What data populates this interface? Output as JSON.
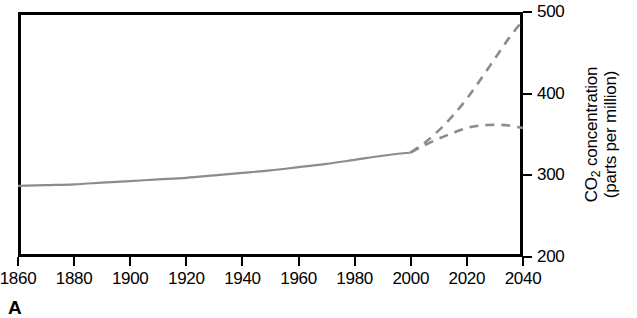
{
  "panel": {
    "letter": "A"
  },
  "chart_data": {
    "type": "line",
    "title": "",
    "xlabel": "",
    "ylabel": "CO2 concentration (parts per million)",
    "ylabel_line1": "CO",
    "ylabel_line1_sub": "2",
    "ylabel_line1_rest": " concentration",
    "ylabel_line2": "(parts per million)",
    "xlim": [
      1860,
      2040
    ],
    "ylim": [
      200,
      500
    ],
    "xticks": [
      1860,
      1880,
      1900,
      1920,
      1940,
      1960,
      1980,
      2000,
      2020,
      2040
    ],
    "xtick_labels": [
      "1860",
      "1880",
      "1900",
      "1920",
      "1940",
      "1960",
      "1980",
      "2000",
      "2020",
      "2040"
    ],
    "yticks": [
      200,
      300,
      400,
      500
    ],
    "ytick_labels": [
      "200",
      "300",
      "400",
      "500"
    ],
    "yaxis_position": "right",
    "grid": false,
    "legend": false,
    "line_color": "#8c8c8c",
    "frame_color": "#000000",
    "series": [
      {
        "name": "Observed CO2 concentration",
        "style": "solid",
        "color": "#8c8c8c",
        "x": [
          1860,
          1870,
          1880,
          1890,
          1900,
          1910,
          1920,
          1930,
          1940,
          1950,
          1960,
          1970,
          1980,
          1990,
          2000
        ],
        "values": [
          287,
          288,
          289,
          291,
          293,
          295,
          297,
          300,
          303,
          306,
          310,
          314,
          319,
          324,
          328
        ]
      },
      {
        "name": "High emissions projection",
        "style": "dashed",
        "color": "#8c8c8c",
        "x": [
          2000,
          2005,
          2010,
          2015,
          2020,
          2025,
          2030,
          2035,
          2040
        ],
        "values": [
          328,
          340,
          355,
          373,
          394,
          418,
          443,
          468,
          490
        ]
      },
      {
        "name": "Low emissions projection",
        "style": "dashed",
        "color": "#8c8c8c",
        "x": [
          2000,
          2005,
          2010,
          2015,
          2020,
          2025,
          2030,
          2035,
          2040
        ],
        "values": [
          328,
          337,
          345,
          352,
          358,
          361,
          362,
          361,
          358
        ]
      }
    ]
  }
}
